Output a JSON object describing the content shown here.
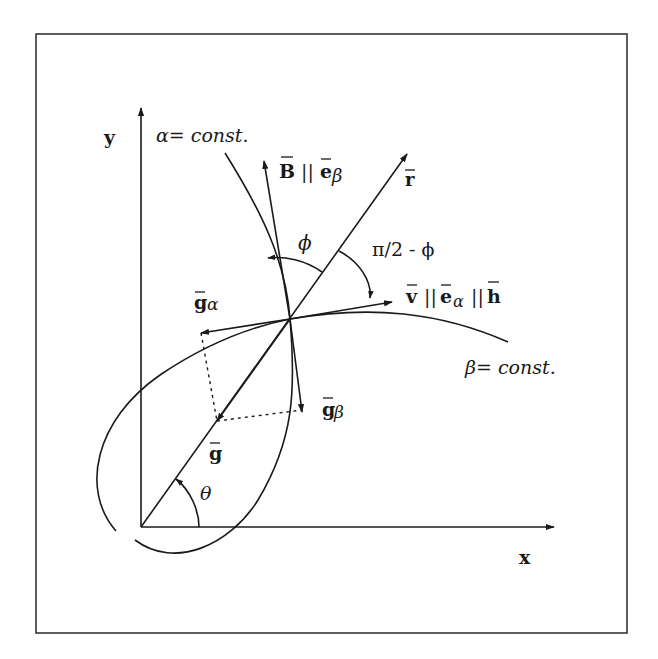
{
  "diagram": {
    "axes": {
      "x_label": "x",
      "y_label": "y"
    },
    "curves": {
      "alpha_label": "α= const.",
      "beta_label": "β= const."
    },
    "vectors": {
      "B_label": "B",
      "B_parallel": "||",
      "e_beta_label": "e",
      "e_beta_sub": "β",
      "r_label": "r",
      "v_label": "v",
      "v_parallel_1": "||",
      "e_alpha_label": "e",
      "e_alpha_sub": "α",
      "v_parallel_2": "||",
      "h_label": "h",
      "g_alpha_label": "g",
      "g_alpha_sub": "α",
      "g_beta_label": "g",
      "g_beta_sub": "β",
      "g_label": "g"
    },
    "angles": {
      "phi_label": "ϕ",
      "pi_half_minus_phi_label": "π/2 - ϕ",
      "theta_label": "θ"
    },
    "colors": {
      "ink": "#1a1a1a",
      "background": "#ffffff"
    }
  }
}
